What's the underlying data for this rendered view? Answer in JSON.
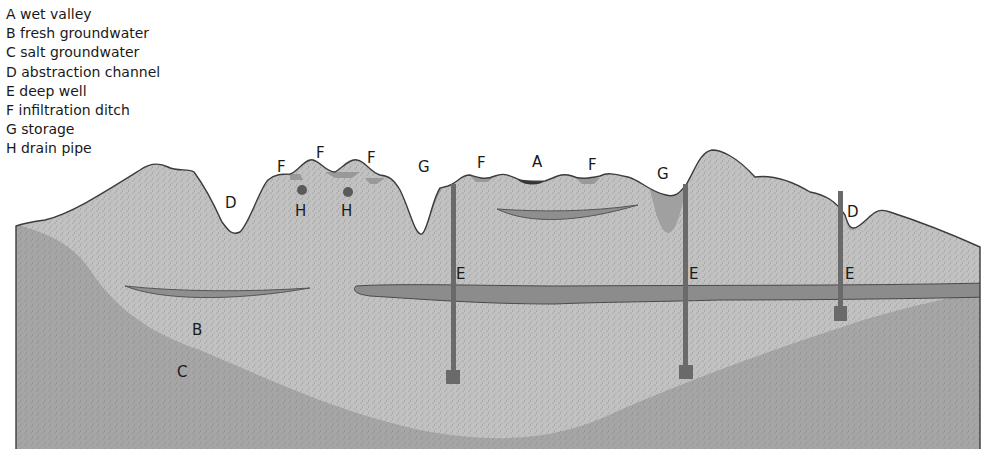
{
  "legend": [
    {
      "key": "A",
      "label": "A wet valley"
    },
    {
      "key": "B",
      "label": "B fresh groundwater"
    },
    {
      "key": "C",
      "label": "C salt groundwater"
    },
    {
      "key": "D",
      "label": "D abstraction channel"
    },
    {
      "key": "E",
      "label": "E deep well"
    },
    {
      "key": "F",
      "label": "F infiltration ditch"
    },
    {
      "key": "G",
      "label": "G storage"
    },
    {
      "key": "H",
      "label": "H drain pipe"
    }
  ],
  "labels": {
    "A": "A",
    "B": "B",
    "C": "C",
    "D": "D",
    "E": "E",
    "F": "F",
    "G": "G",
    "H": "H"
  },
  "colors": {
    "fresh_groundwater": "#bdbdbd",
    "salt_groundwater": "#a4a4a4",
    "water": "#a9a9a9",
    "clay_lens": "#8f8f8f",
    "wet_valley": "#3a3a3a",
    "well": "#6a6a6a",
    "outline": "#3c3c3c"
  }
}
